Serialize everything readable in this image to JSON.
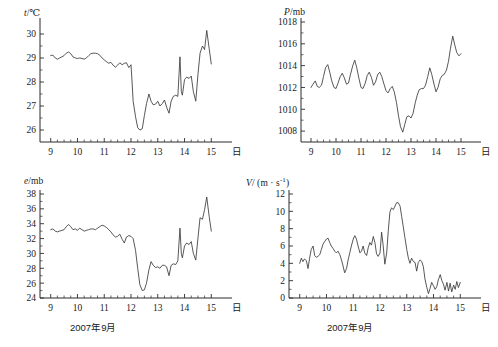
{
  "figure": {
    "x_axis_unit_label": "日",
    "date_label": "2007年9月"
  },
  "panels": [
    {
      "id": "temperature",
      "name": "temperature-panel",
      "y_label_symbol": "t",
      "y_label_unit": "/℃"
    },
    {
      "id": "pressure",
      "name": "pressure-panel",
      "y_label_symbol": "P",
      "y_label_unit": "/mb"
    },
    {
      "id": "vapor-pressure",
      "name": "vapor-pressure-panel",
      "y_label_symbol": "e",
      "y_label_unit": "/mb"
    },
    {
      "id": "wind-speed",
      "name": "wind-speed-panel",
      "y_label_symbol": "V",
      "y_label_unit": "/ (m · s",
      "y_label_exp": "-1",
      "y_label_tail": ")"
    }
  ],
  "chart_data": [
    {
      "type": "line",
      "id": "temperature",
      "title": "",
      "xlabel": "2007年9月",
      "ylabel": "t/℃",
      "xlim": [
        8.6,
        15.4
      ],
      "ylim": [
        25.5,
        30.5
      ],
      "xticks": [
        9,
        10,
        11,
        12,
        13,
        14,
        15
      ],
      "xticklabels": [
        "9",
        "10",
        "11",
        "12",
        "13",
        "14",
        "15"
      ],
      "yticks": [
        26,
        27,
        28,
        29,
        30
      ],
      "yticklabels": [
        "26",
        "27",
        "28",
        "29",
        "30"
      ],
      "minor_x_per_interval": 4,
      "minor_y_per_interval": 2,
      "grid": false,
      "legend": null,
      "x": [
        9.0,
        9.08,
        9.17,
        9.25,
        9.33,
        9.42,
        9.5,
        9.58,
        9.67,
        9.75,
        9.83,
        9.92,
        10.0,
        10.08,
        10.17,
        10.25,
        10.33,
        10.42,
        10.5,
        10.58,
        10.67,
        10.75,
        10.83,
        10.92,
        11.0,
        11.08,
        11.17,
        11.25,
        11.33,
        11.42,
        11.5,
        11.58,
        11.67,
        11.75,
        11.83,
        11.92,
        12.0,
        12.04,
        12.08,
        12.17,
        12.25,
        12.33,
        12.42,
        12.5,
        12.58,
        12.67,
        12.75,
        12.83,
        12.92,
        13.0,
        13.08,
        13.17,
        13.25,
        13.33,
        13.42,
        13.5,
        13.58,
        13.67,
        13.75,
        13.83,
        13.88,
        13.92,
        14.0,
        14.08,
        14.17,
        14.25,
        14.33,
        14.42,
        14.5,
        14.58,
        14.67,
        14.75,
        14.83,
        14.92,
        15.0
      ],
      "y": [
        29.1,
        29.12,
        29.0,
        28.95,
        29.0,
        29.05,
        29.1,
        29.2,
        29.25,
        29.18,
        29.05,
        29.0,
        28.98,
        29.0,
        28.98,
        28.95,
        29.0,
        29.1,
        29.18,
        29.2,
        29.2,
        29.18,
        29.12,
        29.0,
        28.92,
        28.85,
        28.78,
        28.82,
        28.7,
        28.62,
        28.7,
        28.8,
        28.72,
        28.78,
        28.8,
        28.6,
        28.72,
        28.0,
        27.2,
        26.55,
        26.1,
        26.0,
        26.05,
        26.6,
        27.1,
        27.5,
        27.2,
        27.05,
        27.08,
        27.2,
        27.0,
        27.1,
        27.25,
        26.95,
        26.7,
        27.2,
        27.4,
        27.45,
        27.4,
        29.05,
        27.6,
        27.45,
        28.1,
        28.2,
        28.15,
        28.25,
        27.6,
        27.2,
        28.3,
        29.2,
        29.5,
        29.35,
        30.15,
        29.4,
        28.75
      ]
    },
    {
      "type": "line",
      "id": "pressure",
      "title": "",
      "xlabel": "",
      "ylabel": "P/mb",
      "xlim": [
        8.6,
        15.4
      ],
      "ylim": [
        1007.0,
        1018.0
      ],
      "xticks": [
        9,
        10,
        11,
        12,
        13,
        14,
        15
      ],
      "xticklabels": [
        "9",
        "10",
        "11",
        "12",
        "13",
        "14",
        "15"
      ],
      "yticks": [
        1008,
        1010,
        1012,
        1014,
        1016,
        1018
      ],
      "yticklabels": [
        "1008",
        "1010",
        "1012",
        "1014",
        "1016",
        "1018"
      ],
      "minor_x_per_interval": 4,
      "minor_y_per_interval": 2,
      "grid": false,
      "legend": null,
      "x": [
        9.0,
        9.08,
        9.17,
        9.25,
        9.33,
        9.42,
        9.5,
        9.58,
        9.67,
        9.75,
        9.83,
        9.92,
        10.0,
        10.08,
        10.17,
        10.25,
        10.33,
        10.42,
        10.5,
        10.58,
        10.67,
        10.75,
        10.83,
        10.92,
        11.0,
        11.08,
        11.17,
        11.25,
        11.33,
        11.42,
        11.5,
        11.58,
        11.67,
        11.75,
        11.83,
        11.92,
        12.0,
        12.08,
        12.17,
        12.25,
        12.33,
        12.42,
        12.5,
        12.58,
        12.67,
        12.75,
        12.83,
        12.92,
        13.0,
        13.08,
        13.17,
        13.25,
        13.33,
        13.42,
        13.5,
        13.58,
        13.67,
        13.75,
        13.83,
        13.92,
        14.0,
        14.08,
        14.17,
        14.25,
        14.33,
        14.42,
        14.5,
        14.58,
        14.67,
        14.75,
        14.83,
        14.92,
        15.0
      ],
      "y": [
        1012.0,
        1012.3,
        1012.6,
        1012.1,
        1012.0,
        1012.2,
        1013.0,
        1013.8,
        1014.1,
        1013.4,
        1012.6,
        1012.0,
        1011.9,
        1012.4,
        1013.0,
        1013.3,
        1012.9,
        1012.3,
        1012.4,
        1013.2,
        1014.0,
        1014.5,
        1013.8,
        1012.8,
        1012.0,
        1011.9,
        1012.4,
        1013.1,
        1013.4,
        1012.9,
        1012.2,
        1012.5,
        1013.2,
        1013.4,
        1013.0,
        1012.3,
        1011.7,
        1011.5,
        1011.9,
        1012.1,
        1011.6,
        1010.6,
        1009.4,
        1008.4,
        1007.9,
        1008.6,
        1009.3,
        1009.4,
        1009.2,
        1009.6,
        1010.6,
        1011.3,
        1011.8,
        1011.9,
        1011.9,
        1012.2,
        1013.0,
        1013.8,
        1013.2,
        1012.3,
        1011.6,
        1012.0,
        1012.8,
        1013.1,
        1013.2,
        1013.6,
        1014.4,
        1015.6,
        1016.7,
        1015.9,
        1015.2,
        1014.9,
        1015.1
      ]
    },
    {
      "type": "line",
      "id": "vapor-pressure",
      "title": "",
      "xlabel": "2007年9月",
      "ylabel": "e/mb",
      "xlim": [
        8.6,
        15.4
      ],
      "ylim": [
        24.0,
        38.0
      ],
      "xticks": [
        9,
        10,
        11,
        12,
        13,
        14,
        15
      ],
      "xticklabels": [
        "9",
        "10",
        "11",
        "12",
        "13",
        "14",
        "15"
      ],
      "yticks": [
        24,
        26,
        28,
        30,
        32,
        34,
        36,
        38
      ],
      "yticklabels": [
        "24",
        "26",
        "28",
        "30",
        "32",
        "34",
        "36",
        "38"
      ],
      "minor_x_per_interval": 4,
      "minor_y_per_interval": 2,
      "grid": false,
      "legend": null,
      "x": [
        9.0,
        9.08,
        9.17,
        9.25,
        9.33,
        9.42,
        9.5,
        9.58,
        9.67,
        9.75,
        9.83,
        9.92,
        10.0,
        10.08,
        10.17,
        10.25,
        10.33,
        10.42,
        10.5,
        10.58,
        10.67,
        10.75,
        10.83,
        10.92,
        11.0,
        11.08,
        11.17,
        11.25,
        11.33,
        11.42,
        11.5,
        11.58,
        11.67,
        11.75,
        11.83,
        11.92,
        12.0,
        12.08,
        12.17,
        12.25,
        12.33,
        12.42,
        12.5,
        12.58,
        12.67,
        12.75,
        12.83,
        12.92,
        13.0,
        13.08,
        13.17,
        13.25,
        13.33,
        13.42,
        13.5,
        13.58,
        13.67,
        13.75,
        13.83,
        13.88,
        13.92,
        14.0,
        14.08,
        14.17,
        14.25,
        14.33,
        14.42,
        14.5,
        14.58,
        14.67,
        14.75,
        14.83,
        14.92,
        15.0
      ],
      "y": [
        33.2,
        33.3,
        33.0,
        32.9,
        33.0,
        33.1,
        33.2,
        33.6,
        33.9,
        33.6,
        33.2,
        33.3,
        33.1,
        33.4,
        33.2,
        33.0,
        33.1,
        33.2,
        33.3,
        33.3,
        33.2,
        33.4,
        33.6,
        33.8,
        33.7,
        33.5,
        33.2,
        32.9,
        32.5,
        32.2,
        32.3,
        32.6,
        31.9,
        31.4,
        32.2,
        32.4,
        32.3,
        32.0,
        30.4,
        28.0,
        25.8,
        25.0,
        25.1,
        26.0,
        27.8,
        28.9,
        28.4,
        28.1,
        28.2,
        28.0,
        28.4,
        28.4,
        28.2,
        27.0,
        28.4,
        28.6,
        28.5,
        29.0,
        33.4,
        30.0,
        29.4,
        31.0,
        31.4,
        31.2,
        31.6,
        30.0,
        29.1,
        32.0,
        34.8,
        34.6,
        35.9,
        37.6,
        35.0,
        33.0
      ]
    },
    {
      "type": "line",
      "id": "wind-speed",
      "title": "",
      "xlabel": "2007年9月",
      "ylabel": "V/ (m · s⁻¹)",
      "xlim": [
        8.6,
        15.4
      ],
      "ylim": [
        0.0,
        12.0
      ],
      "xticks": [
        9,
        10,
        11,
        12,
        13,
        14,
        15
      ],
      "xticklabels": [
        "9",
        "10",
        "11",
        "12",
        "13",
        "14",
        "15"
      ],
      "yticks": [
        0,
        2,
        4,
        6,
        8,
        10,
        12
      ],
      "yticklabels": [
        "0",
        "2",
        "4",
        "6",
        "8",
        "10",
        "12"
      ],
      "minor_x_per_interval": 4,
      "minor_y_per_interval": 2,
      "grid": false,
      "legend": null,
      "x": [
        9.0,
        9.06,
        9.12,
        9.18,
        9.25,
        9.31,
        9.37,
        9.43,
        9.5,
        9.56,
        9.62,
        9.68,
        9.75,
        9.81,
        9.87,
        9.93,
        10.0,
        10.06,
        10.12,
        10.18,
        10.25,
        10.31,
        10.37,
        10.43,
        10.5,
        10.56,
        10.62,
        10.68,
        10.75,
        10.81,
        10.87,
        10.93,
        11.0,
        11.06,
        11.12,
        11.18,
        11.25,
        11.31,
        11.37,
        11.43,
        11.5,
        11.56,
        11.62,
        11.68,
        11.75,
        11.81,
        11.87,
        11.93,
        12.0,
        12.06,
        12.12,
        12.18,
        12.25,
        12.31,
        12.37,
        12.43,
        12.5,
        12.56,
        12.62,
        12.68,
        12.75,
        12.81,
        12.87,
        12.93,
        13.0,
        13.06,
        13.12,
        13.18,
        13.25,
        13.31,
        13.37,
        13.43,
        13.5,
        13.56,
        13.62,
        13.68,
        13.75,
        13.81,
        13.87,
        13.93,
        14.0,
        14.06,
        14.12,
        14.18,
        14.25,
        14.31,
        14.37,
        14.43,
        14.5,
        14.56,
        14.62,
        14.68,
        14.75,
        14.81,
        14.87,
        14.93,
        15.0
      ],
      "y": [
        4.0,
        4.6,
        4.2,
        4.5,
        4.3,
        3.4,
        4.6,
        5.6,
        6.0,
        4.9,
        4.7,
        4.8,
        5.0,
        5.6,
        6.2,
        6.5,
        6.8,
        6.9,
        6.4,
        6.0,
        5.7,
        5.4,
        5.2,
        5.4,
        5.0,
        4.4,
        3.7,
        2.9,
        3.4,
        4.4,
        5.2,
        6.0,
        6.8,
        7.2,
        6.8,
        6.0,
        5.2,
        5.4,
        6.0,
        5.2,
        4.9,
        5.8,
        6.4,
        6.1,
        7.1,
        6.4,
        5.1,
        4.8,
        5.2,
        7.6,
        6.0,
        3.9,
        5.2,
        7.8,
        9.9,
        10.4,
        10.2,
        10.6,
        11.0,
        11.0,
        10.6,
        9.4,
        8.2,
        7.0,
        5.6,
        4.6,
        4.0,
        4.6,
        4.2,
        4.1,
        3.1,
        4.1,
        4.4,
        4.2,
        3.6,
        2.2,
        1.2,
        0.5,
        1.1,
        1.8,
        1.4,
        1.0,
        1.3,
        2.1,
        2.7,
        2.0,
        1.6,
        0.9,
        1.8,
        0.8,
        1.7,
        0.7,
        1.5,
        1.0,
        1.9,
        1.2,
        1.8
      ]
    }
  ]
}
